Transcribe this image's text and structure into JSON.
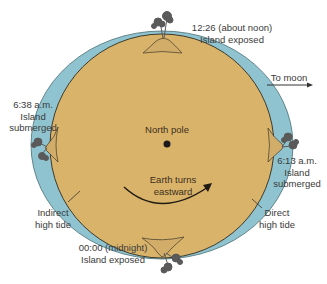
{
  "diagram": {
    "type": "tides-earth-rotation",
    "colors": {
      "earth": "#d9b36a",
      "earth_stroke": "#3f3a2a",
      "ocean": "#8fc3cf",
      "ocean_stroke": "#4a6e74",
      "island": "#d2ad6a",
      "palm": "#555555",
      "ink": "#222222"
    },
    "labels": {
      "top": {
        "line1": "12:26 (about noon)",
        "line2": "Island exposed"
      },
      "moon": "To moon",
      "left": {
        "line1": "6:38 a.m.",
        "line2": "Island",
        "line3": "submerged"
      },
      "right": {
        "line1": "6:13 a.m.",
        "line2": "Island",
        "line3": "submerged"
      },
      "center": "North pole",
      "rotation": {
        "line1": "Earth turns",
        "line2": "eastward"
      },
      "indirect": {
        "line1": "Indirect",
        "line2": "high tide"
      },
      "direct": {
        "line1": "Direct",
        "line2": "high tide"
      },
      "bottom": {
        "line1": "00:00 (midnight)",
        "line2": "Island exposed"
      }
    }
  }
}
